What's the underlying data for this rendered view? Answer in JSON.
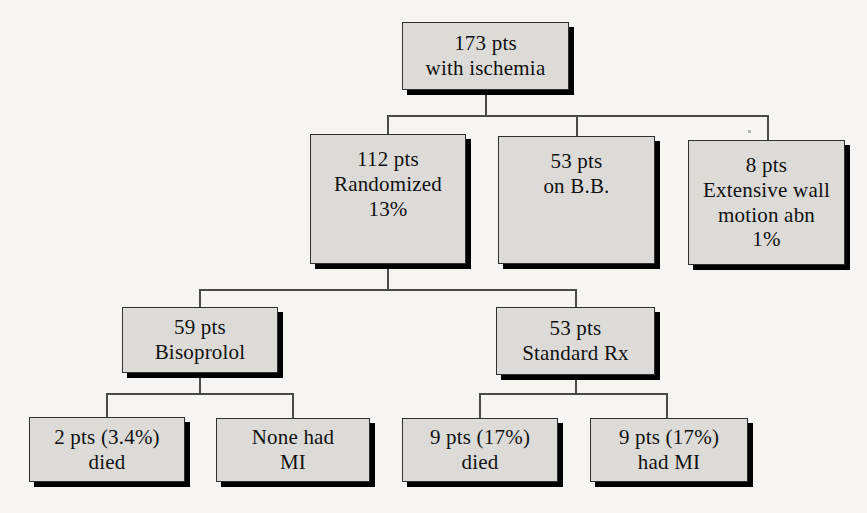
{
  "diagram": {
    "type": "flowchart",
    "style": {
      "background": "#f7f5f2",
      "node_fill": "#dcdbd8",
      "node_border": "#30302e",
      "shadow": "#000000",
      "text": "#111111",
      "connector": "#4a4a4a"
    },
    "nodes": [
      {
        "id": "root",
        "name": "total-patients-node",
        "lines": [
          "173 pts",
          "with ischemia"
        ],
        "level": 0
      },
      {
        "id": "randomized",
        "name": "randomized-node",
        "lines": [
          "112 pts",
          "Randomized",
          "13%"
        ],
        "level": 1
      },
      {
        "id": "on-bb",
        "name": "on-beta-blocker-node",
        "lines": [
          "53 pts",
          "on B.B."
        ],
        "level": 1
      },
      {
        "id": "extensive-wall",
        "name": "extensive-wall-motion-node",
        "lines": [
          "8 pts",
          "Extensive wall",
          "motion abn",
          "1%"
        ],
        "level": 1
      },
      {
        "id": "bisoprolol",
        "name": "bisoprolol-arm-node",
        "lines": [
          "59 pts",
          "Bisoprolol"
        ],
        "level": 2
      },
      {
        "id": "standard-rx",
        "name": "standard-rx-arm-node",
        "lines": [
          "53 pts",
          "Standard Rx"
        ],
        "level": 2
      },
      {
        "id": "biso-died",
        "name": "bisoprolol-died-node",
        "lines": [
          "2 pts (3.4%)",
          "died"
        ],
        "level": 3
      },
      {
        "id": "biso-mi",
        "name": "bisoprolol-mi-node",
        "lines": [
          "None had",
          "MI"
        ],
        "level": 3
      },
      {
        "id": "std-died",
        "name": "standard-died-node",
        "lines": [
          "9 pts (17%)",
          "died"
        ],
        "level": 3
      },
      {
        "id": "std-mi",
        "name": "standard-mi-node",
        "lines": [
          "9 pts (17%)",
          "had MI"
        ],
        "level": 3
      }
    ],
    "edges": [
      {
        "from": "root",
        "to": "randomized"
      },
      {
        "from": "root",
        "to": "on-bb"
      },
      {
        "from": "root",
        "to": "extensive-wall"
      },
      {
        "from": "randomized",
        "to": "bisoprolol"
      },
      {
        "from": "randomized",
        "to": "standard-rx"
      },
      {
        "from": "bisoprolol",
        "to": "biso-died"
      },
      {
        "from": "bisoprolol",
        "to": "biso-mi"
      },
      {
        "from": "standard-rx",
        "to": "std-died"
      },
      {
        "from": "standard-rx",
        "to": "std-mi"
      }
    ]
  }
}
